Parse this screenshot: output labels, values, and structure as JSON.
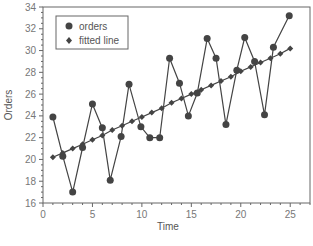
{
  "chart_data": {
    "type": "line",
    "title": "",
    "xlabel": "Time",
    "ylabel": "Orders",
    "xlim": [
      0,
      27
    ],
    "ylim": [
      16,
      34
    ],
    "xticks": [
      0,
      5,
      10,
      15,
      20,
      25
    ],
    "yticks": [
      16,
      18,
      20,
      22,
      24,
      26,
      28,
      30,
      32,
      34
    ],
    "grid": false,
    "legend_position": "top-left",
    "series": [
      {
        "name": "orders",
        "marker": "circle",
        "x": [
          1,
          2,
          3,
          4,
          5,
          6,
          6.8,
          7.9,
          8.7,
          9.9,
          10.8,
          11.8,
          12.8,
          13.8,
          14.7,
          15.6,
          16.6,
          17.5,
          18.5,
          19.6,
          20.4,
          21.4,
          22.4,
          23.3,
          24.9
        ],
        "values": [
          23.9,
          20.3,
          17.0,
          21.1,
          25.1,
          22.9,
          18.1,
          22.1,
          26.9,
          23.0,
          22.0,
          22.0,
          29.3,
          27.0,
          24.0,
          26.1,
          31.1,
          29.3,
          23.2,
          28.2,
          31.2,
          29.0,
          24.1,
          30.3,
          33.2
        ]
      },
      {
        "name": "fitted line",
        "marker": "diamond",
        "x": [
          1,
          2,
          3,
          4,
          5,
          6,
          7,
          8,
          9,
          10,
          11,
          12,
          13,
          14,
          15,
          16,
          17,
          18,
          19,
          20,
          21,
          22,
          23,
          24,
          25
        ],
        "values": [
          20.2,
          20.6,
          21.0,
          21.4,
          21.8,
          22.2,
          22.7,
          23.1,
          23.5,
          23.9,
          24.3,
          24.7,
          25.2,
          25.6,
          26.0,
          26.4,
          26.8,
          27.2,
          27.6,
          28.1,
          28.5,
          28.9,
          29.3,
          29.7,
          30.2
        ]
      }
    ],
    "colors": {
      "series": "#444444",
      "axis": "#666666",
      "text": "#777777"
    }
  }
}
